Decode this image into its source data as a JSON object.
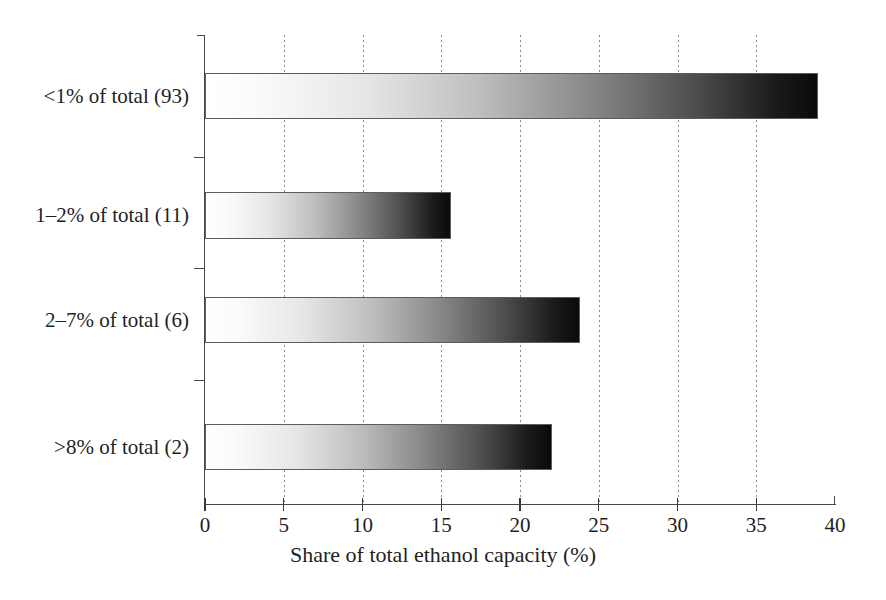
{
  "chart_data": {
    "type": "bar",
    "orientation": "horizontal",
    "title": "",
    "xlabel": "Share of total ethanol capacity (%)",
    "ylabel": "",
    "categories": [
      "<1% of total (93)",
      "1–2% of total (11)",
      "2–7% of total (6)",
      ">8% of total (2)"
    ],
    "values": [
      38.9,
      15.6,
      23.8,
      22.0
    ],
    "xlim": [
      0,
      40
    ],
    "xticks": [
      0,
      5,
      10,
      15,
      20,
      25,
      30,
      35,
      40
    ],
    "xtick_labels": [
      "0",
      "5",
      "10",
      "15",
      "20",
      "25",
      "30",
      "35",
      "40"
    ],
    "grid": "vertical-dotted",
    "legend": "none",
    "bar_style": "white-to-black horizontal gradient fill with thin dark outline",
    "colors": {
      "gradient_start": "#ffffff",
      "gradient_end": "#0a0a0a",
      "bar_outline": "#5d5d5d",
      "axis": "#4a4a4a",
      "gridline": "#8d8d8d",
      "text": "#1f1f1f",
      "background": "#ffffff"
    }
  },
  "layout": {
    "plot_left_px": 205,
    "plot_top_px": 35,
    "plot_width_px": 630,
    "plot_height_px": 470,
    "bars_geometry": [
      {
        "top": 73,
        "height": 46
      },
      {
        "top": 192,
        "height": 47
      },
      {
        "top": 297,
        "height": 46
      },
      {
        "top": 424,
        "height": 46
      }
    ],
    "category_label_y": [
      84,
      203,
      308,
      435
    ],
    "ytick_y": [
      157,
      268,
      380
    ],
    "px_per_unit": 15.75
  }
}
